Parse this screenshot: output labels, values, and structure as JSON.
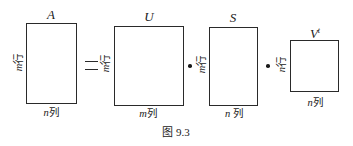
{
  "figure": {
    "caption": "图 9.3",
    "equation": "A = U · S · V^t",
    "operators": {
      "equals": "=",
      "dot": "·"
    },
    "matrices": [
      {
        "name": "A",
        "title": "A",
        "superscript": "",
        "row_var": "m",
        "row_unit": "行",
        "col_var": "n",
        "col_unit": "列"
      },
      {
        "name": "U",
        "title": "U",
        "superscript": "",
        "row_var": "m",
        "row_unit": "行",
        "col_var": "m",
        "col_unit": "列"
      },
      {
        "name": "S",
        "title": "S",
        "superscript": "",
        "row_var": "m",
        "row_unit": "行",
        "col_var": "n",
        "col_unit": "列"
      },
      {
        "name": "V^t",
        "title": "V",
        "superscript": "t",
        "row_var": "n",
        "row_unit": "行",
        "col_var": "n",
        "col_unit": "列"
      }
    ]
  }
}
